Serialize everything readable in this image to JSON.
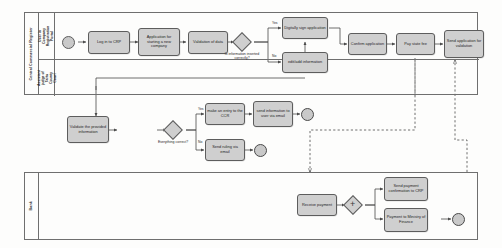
{
  "diagram": {
    "colors": {
      "task_fill": "#cfcfcf",
      "shape_stroke": "#5d5d5d",
      "pool_stroke": "#6f6f6f",
      "background": "#fdfdfc"
    }
  },
  "pools": [
    {
      "name": "Central Commercial Register",
      "lanes": [
        {
          "name": "User in Company Registration Portal"
        },
        {
          "name": "Assistant judge of Tartu County Court"
        }
      ]
    },
    {
      "name": "Bank",
      "lanes": []
    }
  ],
  "nodes": {
    "start_event": "",
    "log_in": "Log in to CRP",
    "application_new_company": "Application for starting a new company",
    "validation_of_data": "Validation of data",
    "gateway_info_correct": "Is information inserted correctly?",
    "digitally_sign": "Digitally sign application",
    "edit_add_information": "edit/add information",
    "confirm_application": "Confirm application",
    "pay_state_fee": "Pay state fee",
    "send_application_validation": "Send application for validation",
    "validate_provided_information": "Validate the provided information",
    "gateway_everything_correct": "Everything correct?",
    "make_entry_ccr": "make an entry to the CCR",
    "send_information_user": "send information to user via email",
    "send_ruling_email": "Send ruling via email",
    "receive_payment": "Receive payment",
    "gateway_parallel": "+",
    "send_payment_confirmation": "Send payment confirmation to CRP",
    "payment_ministry_finance": "Payment to Ministry of Finance"
  },
  "edge_labels": {
    "info_correct_yes": "Yes",
    "info_correct_no": "No",
    "everything_correct_yes": "Yes",
    "everything_correct_no": "No"
  }
}
